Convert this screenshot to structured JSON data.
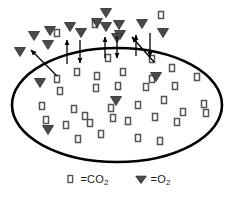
{
  "figure": {
    "background_color": "#ffffff"
  },
  "membrane": {
    "shape": "ellipse",
    "cx": 117,
    "cy": 105,
    "rx": 105,
    "ry": 57,
    "stroke_color": "#000000",
    "stroke_width": 2.6,
    "fill_color": "#ffffff"
  },
  "symbols": {
    "co2": {
      "name": "square",
      "glyph": "□",
      "stroke_color": "#555555",
      "fill_color": "#ffffff",
      "width": 5,
      "height": 7
    },
    "o2": {
      "name": "down-triangle",
      "glyph": "▼",
      "fill_color": "#4a4a4a",
      "stroke_color": "#2b2b2b",
      "width": 11,
      "height": 9
    }
  },
  "legend": {
    "position": "bottom-center",
    "entries": [
      {
        "symbol": "square",
        "equals": "=",
        "label": "CO",
        "subscript": "2",
        "text": "□ = CO2"
      },
      {
        "symbol": "down-triangle",
        "equals": "=",
        "label": "O",
        "subscript": "2",
        "text": "▼ = O2"
      }
    ]
  },
  "arrows": {
    "stroke_color": "#000000",
    "stroke_width": 1.3,
    "outward_label": "CO2 diffusing out",
    "inward_label": "O2 diffusing in",
    "items": [
      {
        "direction": "out",
        "x1": 57,
        "y1": 76,
        "x2": 31,
        "y2": 50
      },
      {
        "direction": "out",
        "x1": 67,
        "y1": 64,
        "x2": 67,
        "y2": 40
      },
      {
        "direction": "in",
        "x1": 80,
        "y1": 40,
        "x2": 80,
        "y2": 63
      },
      {
        "direction": "out",
        "x1": 105,
        "y1": 58,
        "x2": 105,
        "y2": 37
      },
      {
        "direction": "in",
        "x1": 117,
        "y1": 36,
        "x2": 117,
        "y2": 58
      },
      {
        "direction": "out",
        "x1": 136,
        "y1": 56,
        "x2": 136,
        "y2": 35
      },
      {
        "direction": "in",
        "x1": 150,
        "y1": 33,
        "x2": 150,
        "y2": 57
      },
      {
        "direction": "out",
        "x1": 154,
        "y1": 62,
        "x2": 132,
        "y2": 37
      }
    ]
  },
  "outside_o2": {
    "label": "O2 molecules outside the cell",
    "points": [
      [
        20,
        52
      ],
      [
        34,
        36
      ],
      [
        48,
        45
      ],
      [
        50,
        31
      ],
      [
        70,
        27
      ],
      [
        81,
        33
      ],
      [
        97,
        23
      ],
      [
        106,
        13
      ],
      [
        106,
        27
      ],
      [
        119,
        25
      ],
      [
        120,
        35
      ],
      [
        142,
        24
      ],
      [
        163,
        33
      ],
      [
        117,
        38
      ]
    ]
  },
  "outside_co2": {
    "label": "CO2 molecules outside the cell",
    "points": [
      [
        57,
        33
      ],
      [
        95,
        24
      ],
      [
        161,
        15
      ]
    ]
  },
  "inside_co2": {
    "label": "CO2 molecules inside the cell",
    "points": [
      [
        57,
        79
      ],
      [
        108,
        58
      ],
      [
        152,
        59
      ],
      [
        172,
        68
      ],
      [
        77,
        72
      ],
      [
        97,
        76
      ],
      [
        123,
        72
      ],
      [
        152,
        79
      ],
      [
        42,
        106
      ],
      [
        60,
        91
      ],
      [
        96,
        88
      ],
      [
        118,
        86
      ],
      [
        146,
        87
      ],
      [
        175,
        86
      ],
      [
        197,
        77
      ],
      [
        204,
        104
      ],
      [
        74,
        109
      ],
      [
        85,
        116
      ],
      [
        111,
        108
      ],
      [
        138,
        105
      ],
      [
        164,
        100
      ],
      [
        183,
        112
      ],
      [
        206,
        113
      ],
      [
        66,
        125
      ],
      [
        90,
        123
      ],
      [
        113,
        118
      ],
      [
        128,
        121
      ],
      [
        155,
        117
      ],
      [
        177,
        122
      ],
      [
        78,
        139
      ],
      [
        101,
        134
      ],
      [
        138,
        138
      ],
      [
        160,
        141
      ],
      [
        46,
        120
      ]
    ]
  },
  "inside_o2": {
    "label": "O2 molecules inside the cell",
    "points": [
      [
        40,
        83
      ],
      [
        156,
        77
      ],
      [
        116,
        101
      ],
      [
        48,
        130
      ]
    ]
  }
}
